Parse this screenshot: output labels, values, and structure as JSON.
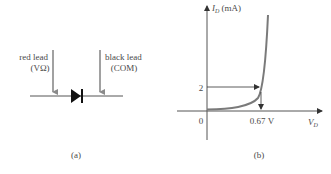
{
  "panel_a": {
    "caption": "(a)",
    "left_lead": {
      "line1": "red lead",
      "line2": "(VΩ)"
    },
    "right_lead": {
      "line1": "black lead",
      "line2": "(COM)"
    },
    "component": "diode"
  },
  "panel_b": {
    "caption": "(b)",
    "y_axis": {
      "symbol": "I",
      "subscript": "D",
      "unit": " (mA)"
    },
    "x_axis": {
      "symbol": "V",
      "subscript": "D"
    },
    "origin_label": "0",
    "y_marker": "2",
    "x_marker": "0.67 V"
  },
  "colors": {
    "arrow": "#8a8a8a",
    "curve": "#7a7a7a",
    "axis": "#555555",
    "diode": "#111111",
    "text": "#4a4a4a"
  }
}
